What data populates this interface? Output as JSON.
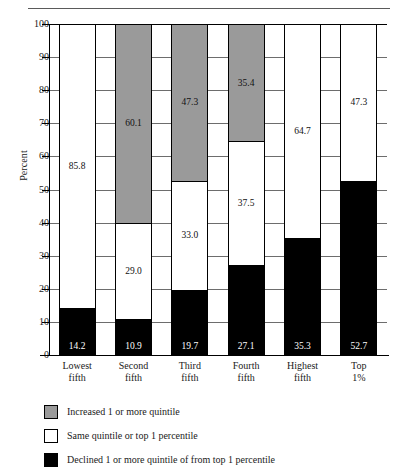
{
  "chart_data": {
    "type": "bar",
    "subtype": "stacked",
    "title": "",
    "xlabel": "",
    "ylabel": "Percent",
    "ylim": [
      0,
      100
    ],
    "yticks": [
      0,
      10,
      20,
      30,
      40,
      50,
      60,
      70,
      80,
      90,
      100
    ],
    "grid": true,
    "legend_position": "below",
    "categories": [
      "Lowest fifth",
      "Second fifth",
      "Third fifth",
      "Fourth fifth",
      "Highest fifth",
      "Top 1%"
    ],
    "category_lines": [
      [
        "Lowest",
        "fifth"
      ],
      [
        "Second",
        "fifth"
      ],
      [
        "Third",
        "fifth"
      ],
      [
        "Fourth",
        "fifth"
      ],
      [
        "Highest",
        "fifth"
      ],
      [
        "Top",
        "1%"
      ]
    ],
    "series": [
      {
        "name": "Declined 1 or more quintile of from top 1 percentile",
        "color": "#000000",
        "values": [
          14.2,
          10.9,
          19.7,
          27.1,
          35.3,
          52.7
        ],
        "labels": [
          "14.2",
          "10.9",
          "19.7",
          "27.1",
          "35.3",
          "52.7"
        ]
      },
      {
        "name": "Same quintile or top 1 percentile",
        "color": "#ffffff",
        "values": [
          85.8,
          29.0,
          33.0,
          37.5,
          64.7,
          47.3
        ],
        "labels": [
          "85.8",
          "29.0",
          "33.0",
          "37.5",
          "64.7",
          "47.3"
        ]
      },
      {
        "name": "Increased 1 or more quintile",
        "color": "#9a9a9a",
        "values": [
          0,
          60.1,
          47.3,
          35.4,
          0,
          0
        ],
        "labels": [
          "",
          "60.1",
          "47.3",
          "35.4",
          "",
          ""
        ]
      }
    ]
  },
  "axis": {
    "y_label": "Percent",
    "y_ticks": [
      "100",
      "90",
      "80",
      "70",
      "60",
      "50",
      "40",
      "30",
      "20",
      "10",
      "0"
    ]
  },
  "legend": {
    "items": [
      {
        "label": "Increased 1 or more quintile",
        "color": "#9a9a9a",
        "swatch": "gray-swatch"
      },
      {
        "label": "Same quintile or top 1 percentile",
        "color": "#ffffff",
        "swatch": "white-swatch"
      },
      {
        "label": "Declined 1 or more quintile of from top 1 percentile",
        "color": "#000000",
        "swatch": "black-swatch"
      }
    ]
  },
  "header": {
    "rule_ghost": ""
  }
}
